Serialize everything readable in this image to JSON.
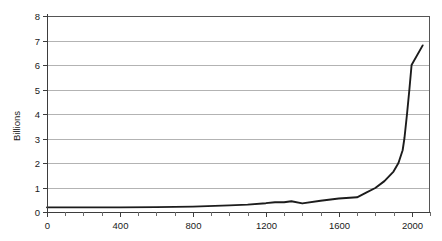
{
  "chart_data": {
    "type": "line",
    "title": "",
    "subtitle": "",
    "xlabel": "",
    "ylabel": "Billions",
    "xlim": [
      0,
      2100
    ],
    "ylim": [
      0,
      8
    ],
    "grid": true,
    "grid_axis": "y",
    "legend": false,
    "legend_position": "none",
    "line_color": "#1c1c1c",
    "gridline_color": "#b3b3b3",
    "axis_color": "#3d3d3d",
    "background_color": "#ffffff",
    "x_ticks": [
      0,
      400,
      800,
      1200,
      1600,
      2000
    ],
    "x_tick_labels": [
      "0",
      "400",
      "800",
      "1200",
      "1600",
      "2000"
    ],
    "x_minor_tick_step": 100,
    "y_ticks": [
      0,
      1,
      2,
      3,
      4,
      5,
      6,
      7,
      8
    ],
    "y_tick_labels": [
      "0",
      "1",
      "2",
      "3",
      "4",
      "5",
      "6",
      "7",
      "8"
    ],
    "series": [
      {
        "name": "World population",
        "x": [
          0,
          200,
          400,
          600,
          800,
          1000,
          1100,
          1200,
          1250,
          1300,
          1340,
          1400,
          1500,
          1600,
          1700,
          1750,
          1800,
          1850,
          1900,
          1927,
          1950,
          1960,
          1974,
          1987,
          1999
        ],
        "values": [
          0.19,
          0.19,
          0.19,
          0.2,
          0.22,
          0.27,
          0.3,
          0.36,
          0.4,
          0.4,
          0.44,
          0.35,
          0.46,
          0.55,
          0.6,
          0.79,
          0.98,
          1.26,
          1.65,
          2.0,
          2.52,
          3.02,
          4.0,
          5.0,
          6.0
        ],
        "peak_value": 6.8,
        "peak_x": 2060
      }
    ],
    "annotations": []
  },
  "axis_titles": {
    "y": "Billions"
  }
}
